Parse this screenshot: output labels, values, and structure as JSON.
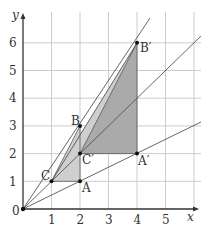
{
  "diagram": {
    "type": "coordinate-geometry-enlargement",
    "axes": {
      "x_label": "x",
      "y_label": "y",
      "origin_label": "0",
      "x_ticks": [
        "1",
        "2",
        "3",
        "4",
        "5"
      ],
      "y_ticks": [
        "1",
        "2",
        "3",
        "4",
        "5",
        "6"
      ]
    },
    "points": {
      "A": {
        "label": "A",
        "x": 2,
        "y": 1
      },
      "B": {
        "label": "B",
        "x": 2,
        "y": 3
      },
      "C": {
        "label": "C",
        "x": 1,
        "y": 1
      },
      "A_prime": {
        "label": "A′",
        "x": 4,
        "y": 2
      },
      "B_prime": {
        "label": "B′",
        "x": 4,
        "y": 6
      },
      "C_prime": {
        "label": "C′",
        "x": 2,
        "y": 2
      }
    },
    "lines_from_origin": [
      "through B and B′",
      "through C and C′",
      "through A and A′"
    ],
    "colors": {
      "grid": "#cccccc",
      "axis": "#333333",
      "line": "#555555",
      "fill_light": "#c8c8c8",
      "fill_dark": "#a8a8a8"
    }
  }
}
